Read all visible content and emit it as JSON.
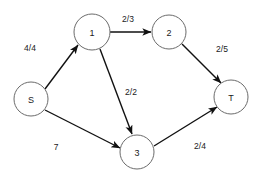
{
  "diagram": {
    "type": "network-flow-graph",
    "title": "",
    "canvas": {
      "width": 259,
      "height": 182
    },
    "colors": {
      "background": "#ffffff",
      "node_stroke": "#6b6b6b",
      "node_fill": "#ffffff",
      "edge_stroke": "#111111",
      "text": "#1a1a1a"
    },
    "nodes": [
      {
        "id": "S",
        "label": "S",
        "cx": 31,
        "cy": 99,
        "r": 17
      },
      {
        "id": "1",
        "label": "1",
        "cx": 92,
        "cy": 32,
        "r": 18
      },
      {
        "id": "2",
        "label": "2",
        "cx": 169,
        "cy": 32,
        "r": 17
      },
      {
        "id": "3",
        "label": "3",
        "cx": 137,
        "cy": 152,
        "r": 17
      },
      {
        "id": "T",
        "label": "T",
        "cx": 231,
        "cy": 97,
        "r": 17
      }
    ],
    "edges": [
      {
        "id": "S-1",
        "from": "S",
        "to": "1",
        "label": "4/4",
        "label_x": 30,
        "label_y": 48,
        "x1": 45,
        "y1": 89,
        "x2": 78,
        "y2": 45
      },
      {
        "id": "1-2",
        "from": "1",
        "to": "2",
        "label": "2/3",
        "label_x": 128,
        "label_y": 19,
        "x1": 110,
        "y1": 32,
        "x2": 151,
        "y2": 32
      },
      {
        "id": "1-3",
        "from": "1",
        "to": "3",
        "label": "2/2",
        "label_x": 131,
        "label_y": 92,
        "x1": 100,
        "y1": 49,
        "x2": 132,
        "y2": 134
      },
      {
        "id": "2-T",
        "from": "2",
        "to": "T",
        "label": "2/5",
        "label_x": 222,
        "label_y": 49,
        "x1": 182,
        "y1": 44,
        "x2": 221,
        "y2": 83
      },
      {
        "id": "S-3",
        "from": "S",
        "to": "3",
        "label": "7",
        "label_x": 56,
        "label_y": 147,
        "x1": 45,
        "y1": 110,
        "x2": 120,
        "y2": 148
      },
      {
        "id": "3-T",
        "from": "3",
        "to": "T",
        "label": "2/4",
        "label_x": 200,
        "label_y": 146,
        "x1": 154,
        "y1": 146,
        "x2": 217,
        "y2": 107
      }
    ]
  }
}
